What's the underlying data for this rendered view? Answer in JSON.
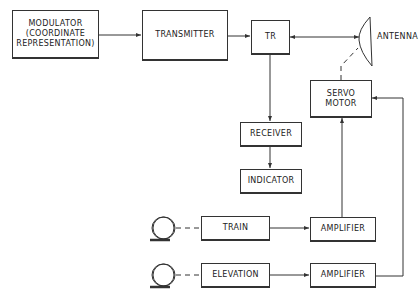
{
  "diagram": {
    "type": "radar block diagram",
    "blocks": {
      "modulator": "MODULATOR\n(COORDINATE\nREPRESENTATION)",
      "transmitter": "TRANSMITTER",
      "tr": "TR",
      "servo_motor": "SERVO\nMOTOR",
      "receiver": "RECEIVER",
      "indicator": "INDICATOR",
      "train": "TRAIN",
      "train_amplifier": "AMPLIFIER",
      "elevation": "ELEVATION",
      "elevation_amplifier": "AMPLIFIER"
    },
    "antenna_label": "ANTENNA",
    "connections": [
      [
        "modulator",
        "transmitter"
      ],
      [
        "transmitter",
        "tr"
      ],
      [
        "tr",
        "antenna",
        "bidirectional"
      ],
      [
        "tr",
        "receiver"
      ],
      [
        "receiver",
        "indicator"
      ],
      [
        "servo_motor",
        "antenna",
        "dashed"
      ],
      [
        "train_handwheel",
        "train",
        "dashed"
      ],
      [
        "train",
        "train_amplifier"
      ],
      [
        "train_amplifier",
        "servo_motor"
      ],
      [
        "elevation_handwheel",
        "elevation",
        "dashed"
      ],
      [
        "elevation",
        "elevation_amplifier"
      ],
      [
        "elevation_amplifier",
        "servo_motor"
      ]
    ]
  }
}
